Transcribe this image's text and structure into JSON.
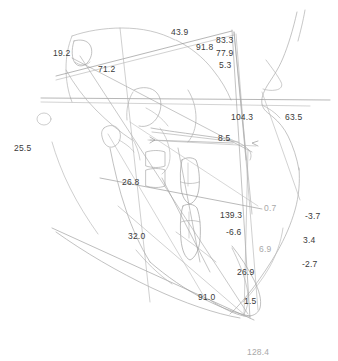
{
  "diagram": {
    "type": "lateral-cephalometric-tracing",
    "background_color": "#ffffff",
    "trace_color": "#9a9a9a",
    "label_color": "#3a3a3a",
    "label_color_muted": "#a9a9a9"
  },
  "measurements": [
    {
      "id": "m-25-5",
      "value": "25.5",
      "x": 14,
      "y": 144,
      "tone": "dark"
    },
    {
      "id": "m-19-2",
      "value": "19.2",
      "x": 53,
      "y": 49,
      "tone": "dark"
    },
    {
      "id": "m-71-2",
      "value": "71.2",
      "x": 98,
      "y": 65,
      "tone": "dark"
    },
    {
      "id": "m-43-9",
      "value": "43.9",
      "x": 171,
      "y": 28,
      "tone": "dark"
    },
    {
      "id": "m-91-8",
      "value": "91.8",
      "x": 196,
      "y": 43,
      "tone": "dark"
    },
    {
      "id": "m-83-3",
      "value": "83.3",
      "x": 216,
      "y": 36,
      "tone": "dark"
    },
    {
      "id": "m-77-9",
      "value": "77.9",
      "x": 216,
      "y": 49,
      "tone": "dark"
    },
    {
      "id": "m-5-3",
      "value": "5.3",
      "x": 219,
      "y": 61,
      "tone": "dark"
    },
    {
      "id": "m-104-3",
      "value": "104.3",
      "x": 231,
      "y": 113,
      "tone": "dark"
    },
    {
      "id": "m-63-5",
      "value": "63.5",
      "x": 285,
      "y": 113,
      "tone": "dark"
    },
    {
      "id": "m-8-5",
      "value": "8.5",
      "x": 218,
      "y": 134,
      "tone": "dark"
    },
    {
      "id": "m-26-8",
      "value": "26.8",
      "x": 122,
      "y": 178,
      "tone": "dark"
    },
    {
      "id": "m-32-0",
      "value": "32.0",
      "x": 128,
      "y": 232,
      "tone": "dark"
    },
    {
      "id": "m-139-3",
      "value": "139.3",
      "x": 220,
      "y": 211,
      "tone": "dark"
    },
    {
      "id": "m-0-7",
      "value": "0.7",
      "x": 264,
      "y": 204,
      "tone": "muted"
    },
    {
      "id": "m-6-6",
      "value": "-6.6",
      "x": 226,
      "y": 228,
      "tone": "dark"
    },
    {
      "id": "m-6-9",
      "value": "6.9",
      "x": 259,
      "y": 245,
      "tone": "muted"
    },
    {
      "id": "m-3-7",
      "value": "-3.7",
      "x": 305,
      "y": 212,
      "tone": "dark"
    },
    {
      "id": "m-3-4",
      "value": "3.4",
      "x": 303,
      "y": 236,
      "tone": "dark"
    },
    {
      "id": "m-2-7",
      "value": "-2.7",
      "x": 302,
      "y": 260,
      "tone": "dark"
    },
    {
      "id": "m-26-9",
      "value": "26.9",
      "x": 237,
      "y": 268,
      "tone": "dark"
    },
    {
      "id": "m-91-0",
      "value": "91.0",
      "x": 198,
      "y": 293,
      "tone": "dark"
    },
    {
      "id": "m-1-5",
      "value": "1.5",
      "x": 244,
      "y": 297,
      "tone": "dark"
    },
    {
      "id": "m-128-4",
      "value": "128.4",
      "x": 247,
      "y": 348,
      "tone": "muted"
    }
  ]
}
